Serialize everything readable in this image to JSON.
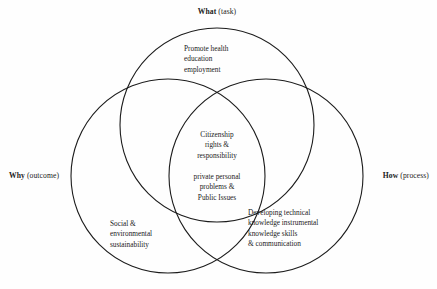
{
  "diagram": {
    "title_labels": {
      "top": {
        "strong": "What",
        "rest": " (task)"
      },
      "left": {
        "strong": "Why",
        "rest": " (outcome)"
      },
      "right": {
        "strong": "How",
        "rest": " (process)"
      }
    },
    "regions": {
      "top_circle": {
        "name": "what-task-region",
        "lines": [
          "Promote health",
          "education",
          "employment"
        ]
      },
      "center_overlap_upper": {
        "name": "center-overlap-upper",
        "lines": [
          "Citizenship",
          "rights &",
          "responsibility"
        ]
      },
      "center_overlap_lower": {
        "name": "center-overlap-lower",
        "lines": [
          "private personal",
          "problems &",
          "Public Issues"
        ]
      },
      "left_circle": {
        "name": "why-outcome-region",
        "lines": [
          "Social &",
          "environmental",
          "sustainability"
        ]
      },
      "right_circle": {
        "name": "how-process-region",
        "lines": [
          "Developing technical",
          "knowledge instrumental",
          "knowledge skills",
          "& communication"
        ]
      }
    },
    "geometry": {
      "circles": [
        {
          "id": "circle-what",
          "cx": 217,
          "cy": 125,
          "r": 97
        },
        {
          "id": "circle-why",
          "cx": 168,
          "cy": 176,
          "r": 97
        },
        {
          "id": "circle-how",
          "cx": 266,
          "cy": 176,
          "r": 97
        }
      ],
      "stroke_color": "#1c1c1c",
      "stroke_width": 1.1,
      "fill": "none"
    },
    "colors": {
      "background": "#fefefe",
      "text": "#1a1a1a",
      "outline": "#1c1c1c"
    }
  }
}
